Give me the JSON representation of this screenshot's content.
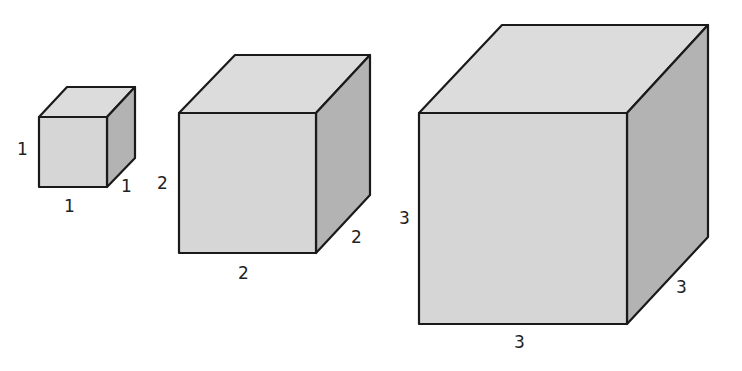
{
  "diagram": {
    "title": "",
    "colors": {
      "front": "#d6d6d6",
      "top": "#dcdcdc",
      "side": "#b3b3b3",
      "edge": "#1a1a1a"
    },
    "cubes": [
      {
        "name": "cube-1",
        "side_length": "1",
        "labels": {
          "height": "1",
          "width": "1",
          "depth": "1"
        }
      },
      {
        "name": "cube-2",
        "side_length": "2",
        "labels": {
          "height": "2",
          "width": "2",
          "depth": "2"
        }
      },
      {
        "name": "cube-3",
        "side_length": "3",
        "labels": {
          "height": "3",
          "width": "3",
          "depth": "3"
        }
      }
    ]
  }
}
